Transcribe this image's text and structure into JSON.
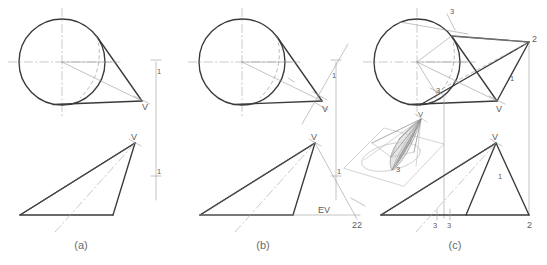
{
  "figure": {
    "colors": {
      "cut_line": "#3a3a3a",
      "visible_line": "#4a4a4a",
      "thin_construction": "#9a9a9a",
      "hidden_line": "#a0a0a0",
      "center_line": "#a5a5a5",
      "label_text": "#5d5d5d",
      "caption_text": "#6b6b6b",
      "background": "#ffffff",
      "iso_shade": "#cfcfcf"
    },
    "captions": [
      {
        "name": "caption-a",
        "label": "(a)"
      },
      {
        "name": "caption-b",
        "label": "(b)"
      },
      {
        "name": "caption-c",
        "label": "(c)"
      }
    ],
    "panels": [
      {
        "id": "a",
        "caption": "(a)",
        "views": [
          "top-view",
          "front-view"
        ],
        "labels": [
          {
            "text": "V",
            "role": "apex-top-view"
          },
          {
            "text": "1",
            "role": "reference-line-top"
          },
          {
            "text": "V",
            "role": "apex-front-view"
          },
          {
            "text": "1",
            "role": "reference-line-front"
          }
        ]
      },
      {
        "id": "b",
        "caption": "(b)",
        "views": [
          "top-view",
          "front-view"
        ],
        "labels": [
          {
            "text": "V",
            "role": "apex-top-view"
          },
          {
            "text": "1",
            "role": "reference-line-top"
          },
          {
            "text": "V",
            "role": "apex-front-view"
          },
          {
            "text": "1",
            "role": "reference-line-front"
          },
          {
            "text": "EV",
            "role": "edge-view-plane"
          },
          {
            "text": "2",
            "role": "auxiliary-reference-line"
          }
        ]
      },
      {
        "id": "c",
        "caption": "(c)",
        "views": [
          "top-view",
          "front-view",
          "pictorial-inset"
        ],
        "labels": [
          {
            "text": "3",
            "role": "auxiliary-line-3-top"
          },
          {
            "text": "2",
            "role": "auxiliary-line-2-top"
          },
          {
            "text": "3",
            "role": "point-3-top-view"
          },
          {
            "text": "V",
            "role": "apex-top-view"
          },
          {
            "text": "1",
            "role": "reference-line-top"
          },
          {
            "text": "V",
            "role": "apex-front-view"
          },
          {
            "text": "1",
            "role": "reference-line-front"
          },
          {
            "text": "3",
            "role": "point-3-front-view"
          },
          {
            "text": "3",
            "role": "point-3-prime-front-view"
          },
          {
            "text": "2",
            "role": "point-2-front-view"
          },
          {
            "text": "2",
            "role": "point-2-left-front-view"
          }
        ]
      }
    ],
    "pictorial": {
      "name": "isometric-inset",
      "description": "Isometric pictorial of cone on horizontal plane cut by an inclined plane",
      "labels": [
        {
          "text": "V",
          "role": "apex"
        },
        {
          "text": "3",
          "role": "element-3"
        }
      ]
    }
  }
}
